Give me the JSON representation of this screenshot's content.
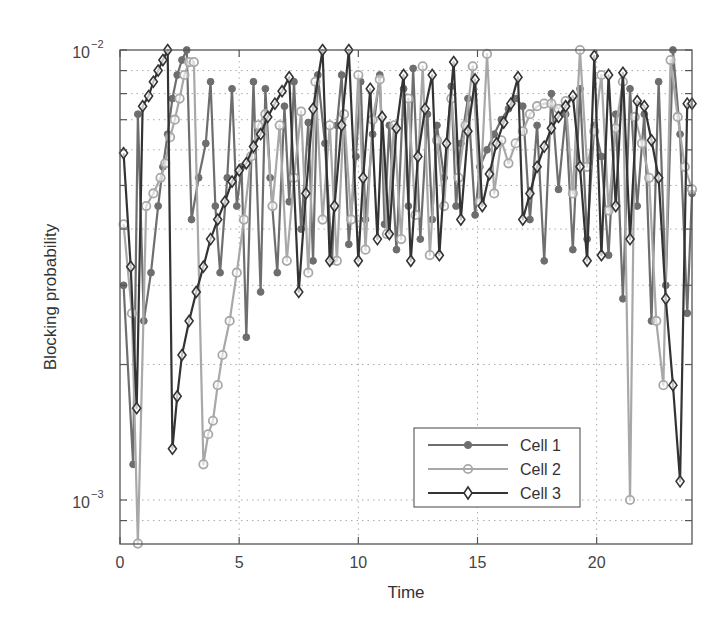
{
  "chart_data": {
    "type": "line",
    "title": "",
    "xlabel": "Time",
    "ylabel": "Blocking probability",
    "xlim": [
      0,
      24
    ],
    "ylim": [
      0.0008,
      0.01
    ],
    "yscale": "log",
    "grid": true,
    "legend_position": "lower right",
    "x_ticks": [
      0,
      5,
      10,
      15,
      20
    ],
    "x_tick_labels": [
      "0",
      "5",
      "10",
      "15",
      "20"
    ],
    "y_ticks": [
      0.001,
      0.01
    ],
    "y_tick_labels": [
      {
        "base": "10",
        "exp": "−3"
      },
      {
        "base": "10",
        "exp": "−2"
      }
    ],
    "y_minor_ticks": [
      0.0009,
      0.002,
      0.003,
      0.004,
      0.005,
      0.006,
      0.007,
      0.008,
      0.009
    ],
    "series": [
      {
        "name": "Cell 1",
        "color": "#6e6e6e",
        "marker": "filled-circle",
        "x": [
          0.15,
          0.55,
          0.75,
          1.0,
          1.3,
          1.6,
          1.8,
          2.0,
          2.2,
          2.4,
          2.6,
          2.8,
          3.0,
          3.3,
          3.6,
          3.8,
          4.0,
          4.2,
          4.5,
          4.7,
          4.9,
          5.1,
          5.3,
          5.6,
          5.9,
          6.1,
          6.3,
          6.6,
          6.9,
          7.1,
          7.3,
          7.6,
          7.9,
          8.1,
          8.3,
          8.6,
          8.9,
          9.1,
          9.3,
          9.6,
          9.9,
          10.1,
          10.3,
          10.6,
          10.9,
          11.1,
          11.3,
          11.6,
          11.9,
          12.1,
          12.3,
          12.6,
          12.9,
          13.1,
          13.3,
          13.6,
          13.9,
          14.1,
          14.3,
          14.6,
          14.9,
          15.1,
          15.4,
          15.7,
          16.0,
          16.3,
          16.6,
          16.9,
          17.2,
          17.5,
          17.8,
          18.1,
          18.4,
          18.7,
          19.0,
          19.3,
          19.6,
          19.9,
          20.2,
          20.5,
          20.8,
          21.1,
          21.4,
          21.7,
          22.0,
          22.3,
          22.6,
          22.9,
          23.2,
          23.5,
          23.8,
          24.0
        ],
        "y": [
          0.003,
          0.0012,
          0.0072,
          0.0025,
          0.0032,
          0.0045,
          0.0055,
          0.0065,
          0.0078,
          0.0088,
          0.0095,
          0.01,
          0.0042,
          0.0052,
          0.0062,
          0.0085,
          0.0045,
          0.0032,
          0.0052,
          0.0082,
          0.0045,
          0.0055,
          0.0023,
          0.0085,
          0.0029,
          0.0082,
          0.0052,
          0.0032,
          0.0075,
          0.0046,
          0.0085,
          0.004,
          0.0069,
          0.0034,
          0.0088,
          0.0062,
          0.0034,
          0.0068,
          0.0088,
          0.0037,
          0.0058,
          0.0085,
          0.0042,
          0.0065,
          0.0088,
          0.0041,
          0.0068,
          0.0036,
          0.0082,
          0.0045,
          0.0091,
          0.0038,
          0.0072,
          0.0042,
          0.0068,
          0.0052,
          0.0083,
          0.0045,
          0.0062,
          0.0078,
          0.0043,
          0.0055,
          0.006,
          0.0065,
          0.007,
          0.0074,
          0.0078,
          0.0075,
          0.0042,
          0.0068,
          0.0034,
          0.008,
          0.0049,
          0.0072,
          0.0036,
          0.0082,
          0.0038,
          0.0068,
          0.0058,
          0.0035,
          0.0072,
          0.0028,
          0.0082,
          0.0045,
          0.0072,
          0.0025,
          0.0085,
          0.003,
          0.01,
          0.0065,
          0.0026,
          0.0048
        ]
      },
      {
        "name": "Cell 2",
        "color": "#a8a8a8",
        "marker": "open-circle",
        "x": [
          0.15,
          0.5,
          0.75,
          1.1,
          1.4,
          1.7,
          1.9,
          2.1,
          2.3,
          2.5,
          2.7,
          2.9,
          3.1,
          3.5,
          3.7,
          3.9,
          4.1,
          4.3,
          4.6,
          4.9,
          5.2,
          5.5,
          5.8,
          6.1,
          6.4,
          6.7,
          7.0,
          7.3,
          7.6,
          7.9,
          8.2,
          8.5,
          8.8,
          9.1,
          9.4,
          9.7,
          10.0,
          10.3,
          10.6,
          10.9,
          11.2,
          11.5,
          11.8,
          12.1,
          12.4,
          12.7,
          13.0,
          13.3,
          13.6,
          13.9,
          14.2,
          14.5,
          14.8,
          15.1,
          15.4,
          15.7,
          16.0,
          16.3,
          16.6,
          16.9,
          17.2,
          17.5,
          17.8,
          18.1,
          18.4,
          18.7,
          19.0,
          19.3,
          19.6,
          19.9,
          20.2,
          20.5,
          20.8,
          21.1,
          21.4,
          21.6,
          21.9,
          22.2,
          22.5,
          22.8,
          23.1,
          23.4,
          23.7,
          24.0
        ],
        "y": [
          0.0041,
          0.0026,
          0.0008,
          0.0045,
          0.0048,
          0.0052,
          0.0056,
          0.0064,
          0.007,
          0.0078,
          0.0088,
          0.0094,
          0.0094,
          0.0012,
          0.0014,
          0.0015,
          0.0018,
          0.0021,
          0.0025,
          0.0032,
          0.0042,
          0.0058,
          0.0068,
          0.0072,
          0.0045,
          0.0068,
          0.0034,
          0.0052,
          0.0073,
          0.0032,
          0.0085,
          0.0042,
          0.0068,
          0.0034,
          0.0072,
          0.0042,
          0.0088,
          0.0036,
          0.007,
          0.0086,
          0.0039,
          0.0068,
          0.0038,
          0.0078,
          0.0043,
          0.0092,
          0.0035,
          0.0063,
          0.0045,
          0.0078,
          0.0052,
          0.0068,
          0.0092,
          0.0046,
          0.0098,
          0.0048,
          0.0063,
          0.0056,
          0.0062,
          0.0066,
          0.0072,
          0.0075,
          0.0076,
          0.0076,
          0.0074,
          0.0077,
          0.0048,
          0.01,
          0.0055,
          0.0066,
          0.0088,
          0.0044,
          0.0067,
          0.0085,
          0.001,
          0.0071,
          0.0062,
          0.0052,
          0.0025,
          0.0018,
          0.0095,
          0.0071,
          0.0055,
          0.0049
        ]
      },
      {
        "name": "Cell 3",
        "color": "#333333",
        "marker": "open-diamond",
        "x": [
          0.15,
          0.45,
          0.7,
          0.95,
          1.2,
          1.4,
          1.6,
          1.8,
          2.0,
          2.2,
          2.4,
          2.6,
          2.9,
          3.2,
          3.5,
          3.8,
          4.1,
          4.4,
          4.7,
          5.0,
          5.3,
          5.6,
          5.9,
          6.2,
          6.5,
          6.8,
          7.1,
          7.5,
          7.8,
          8.1,
          8.5,
          8.8,
          9.0,
          9.3,
          9.6,
          10.0,
          10.2,
          10.5,
          10.8,
          11.0,
          11.3,
          11.6,
          11.9,
          12.2,
          12.5,
          12.8,
          13.1,
          13.4,
          13.7,
          14.0,
          14.3,
          14.6,
          14.9,
          15.2,
          15.5,
          15.8,
          16.1,
          16.4,
          16.7,
          16.9,
          17.2,
          17.5,
          17.8,
          18.1,
          18.4,
          18.7,
          19.0,
          19.3,
          19.6,
          19.9,
          20.2,
          20.5,
          20.8,
          21.1,
          21.4,
          21.7,
          22.0,
          22.3,
          22.6,
          22.9,
          23.2,
          23.5,
          23.8,
          24.0
        ],
        "y": [
          0.0059,
          0.0033,
          0.0016,
          0.0075,
          0.0079,
          0.0085,
          0.009,
          0.0095,
          0.01,
          0.0013,
          0.0017,
          0.0021,
          0.0025,
          0.0029,
          0.0033,
          0.0038,
          0.0042,
          0.0046,
          0.0051,
          0.0054,
          0.0056,
          0.0061,
          0.0065,
          0.0071,
          0.0076,
          0.0081,
          0.0087,
          0.0029,
          0.0048,
          0.0074,
          0.01,
          0.0034,
          0.0045,
          0.0068,
          0.01,
          0.0034,
          0.0052,
          0.0082,
          0.0038,
          0.0071,
          0.0039,
          0.0067,
          0.0088,
          0.0034,
          0.0058,
          0.0074,
          0.0088,
          0.0035,
          0.0062,
          0.0094,
          0.0042,
          0.0066,
          0.0086,
          0.0045,
          0.0053,
          0.0062,
          0.0069,
          0.0076,
          0.0087,
          0.0042,
          0.0048,
          0.0055,
          0.0061,
          0.0067,
          0.0071,
          0.0075,
          0.0079,
          0.0055,
          0.0034,
          0.0097,
          0.0035,
          0.0088,
          0.0045,
          0.0089,
          0.0038,
          0.0077,
          0.0075,
          0.0063,
          0.0052,
          0.0028,
          0.0018,
          0.0011,
          0.0076,
          0.0076
        ]
      }
    ]
  }
}
